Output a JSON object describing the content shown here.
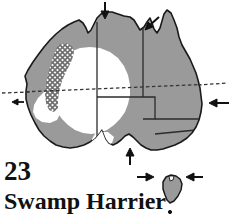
{
  "figure": {
    "type": "distribution-range-map",
    "region": "Australia",
    "plate_number": "23",
    "species_name": "Swamp Harrier"
  },
  "colors": {
    "range_fill": "#9a9a9a",
    "absent_fill": "#ffffff",
    "hatch_stroke": "#6e6e6e",
    "coastline": "#1a1a1a",
    "state_border": "#2b2b2b",
    "tropic_line": "#333333",
    "arrow": "#111111",
    "text": "#111111",
    "background": "#ffffff"
  },
  "legend_semantics": {
    "shaded_area": "resident / breeding range",
    "white_area": "absent (arid interior)",
    "hatched_area": "transitional / irregular occurrence",
    "arrows": "migration / dispersal direction"
  },
  "map_features": {
    "coastline_name": "australia-coastline",
    "tasmania_name": "tasmania-island",
    "tropic_line_label": "tropic-of-capricorn",
    "state_borders_count": 5,
    "arrows_count": 8
  },
  "arrows": [
    {
      "name": "arrow-north-coast-inbound",
      "direction": "down",
      "x": 105,
      "y": 3,
      "len": 16
    },
    {
      "name": "arrow-gulf-carpentaria",
      "direction": "down-left",
      "x": 150,
      "y": 24,
      "len": 15
    },
    {
      "name": "arrow-east-coast-inbound",
      "direction": "left",
      "x": 210,
      "y": 102,
      "len": 17
    },
    {
      "name": "arrow-west-coast-outbound",
      "direction": "left",
      "x": 14,
      "y": 101,
      "len": 12
    },
    {
      "name": "arrow-south-coast-inbound",
      "direction": "up",
      "x": 130,
      "y": 152,
      "len": 15
    },
    {
      "name": "arrow-bass-strait-west",
      "direction": "right",
      "x": 145,
      "y": 177,
      "len": 15
    },
    {
      "name": "arrow-bass-strait-east",
      "direction": "left",
      "x": 188,
      "y": 177,
      "len": 15
    },
    {
      "name": "arrow-tasmania-marker",
      "direction": "down",
      "x": 170,
      "y": 163,
      "len": 0
    }
  ]
}
